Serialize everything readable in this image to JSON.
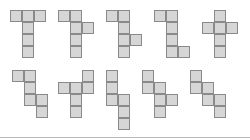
{
  "diagram": {
    "cell_size": 12,
    "colors": {
      "fill": "#d6d6d6",
      "stroke": "#8a8a8a",
      "baseline": "#b8b8b8",
      "background": "#ffffff"
    },
    "figures": [
      {
        "id": 1,
        "row": 1,
        "x": 10,
        "y": 10,
        "cells": [
          [
            0,
            0
          ],
          [
            1,
            0
          ],
          [
            2,
            0
          ],
          [
            1,
            1
          ],
          [
            1,
            2
          ],
          [
            1,
            3
          ]
        ]
      },
      {
        "id": 2,
        "row": 1,
        "x": 58,
        "y": 10,
        "cells": [
          [
            0,
            0
          ],
          [
            1,
            0
          ],
          [
            1,
            1
          ],
          [
            2,
            1
          ],
          [
            1,
            2
          ],
          [
            1,
            3
          ]
        ]
      },
      {
        "id": 3,
        "row": 1,
        "x": 106,
        "y": 10,
        "cells": [
          [
            0,
            0
          ],
          [
            1,
            0
          ],
          [
            1,
            1
          ],
          [
            1,
            2
          ],
          [
            2,
            2
          ],
          [
            1,
            3
          ]
        ]
      },
      {
        "id": 4,
        "row": 1,
        "x": 154,
        "y": 10,
        "cells": [
          [
            0,
            0
          ],
          [
            1,
            0
          ],
          [
            1,
            1
          ],
          [
            1,
            2
          ],
          [
            1,
            3
          ],
          [
            2,
            3
          ]
        ]
      },
      {
        "id": 5,
        "row": 1,
        "x": 202,
        "y": 10,
        "cells": [
          [
            1,
            0
          ],
          [
            0,
            1
          ],
          [
            1,
            1
          ],
          [
            2,
            1
          ],
          [
            1,
            2
          ],
          [
            1,
            3
          ]
        ]
      },
      {
        "id": 6,
        "row": 2,
        "x": 12,
        "y": 70,
        "cells": [
          [
            0,
            0
          ],
          [
            1,
            0
          ],
          [
            1,
            1
          ],
          [
            1,
            2
          ],
          [
            2,
            2
          ],
          [
            2,
            3
          ]
        ]
      },
      {
        "id": 7,
        "row": 2,
        "x": 58,
        "y": 70,
        "cells": [
          [
            2,
            0
          ],
          [
            0,
            1
          ],
          [
            1,
            1
          ],
          [
            2,
            1
          ],
          [
            1,
            2
          ],
          [
            1,
            3
          ]
        ]
      },
      {
        "id": 8,
        "row": 2,
        "x": 106,
        "y": 70,
        "cells": [
          [
            0,
            0
          ],
          [
            0,
            1
          ],
          [
            0,
            2
          ],
          [
            1,
            2
          ],
          [
            1,
            3
          ],
          [
            1,
            4
          ]
        ]
      },
      {
        "id": 9,
        "row": 2,
        "x": 142,
        "y": 70,
        "cells": [
          [
            0,
            0
          ],
          [
            0,
            1
          ],
          [
            1,
            1
          ],
          [
            1,
            2
          ],
          [
            2,
            2
          ],
          [
            1,
            3
          ]
        ]
      },
      {
        "id": 10,
        "row": 2,
        "x": 190,
        "y": 70,
        "cells": [
          [
            0,
            0
          ],
          [
            0,
            1
          ],
          [
            1,
            1
          ],
          [
            1,
            2
          ],
          [
            2,
            2
          ],
          [
            2,
            3
          ]
        ]
      }
    ]
  }
}
